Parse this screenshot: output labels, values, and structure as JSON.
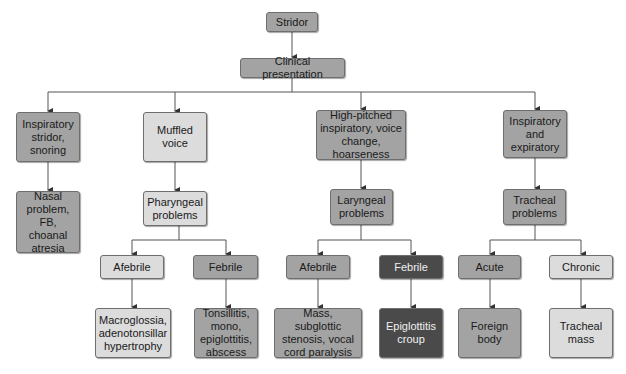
{
  "diagram": {
    "title": "Stridor",
    "colors": {
      "line": "#555555",
      "mid_gray": "#a3a3a3",
      "light_gray": "#dcdcdc",
      "dark_gray": "#4a4a4a"
    },
    "nodes": {
      "root": {
        "label": "Stridor"
      },
      "clinical": {
        "label": "Clinical presentation"
      },
      "insp_snoring": {
        "label": "Inspiratory stridor, snoring"
      },
      "muffled": {
        "label": "Muffled voice"
      },
      "high_pitched": {
        "label": "High-pitched inspiratory, voice change, hoarseness"
      },
      "insp_exp": {
        "label": "Inspiratory and expiratory"
      },
      "nasal": {
        "label": "Nasal problem, FB, choanal atresia"
      },
      "pharyngeal": {
        "label": "Pharyngeal problems"
      },
      "laryngeal": {
        "label": "Laryngeal problems"
      },
      "tracheal": {
        "label": "Tracheal problems"
      },
      "pharyngeal_afebrile": {
        "label": "Afebrile"
      },
      "pharyngeal_febrile": {
        "label": "Febrile"
      },
      "laryngeal_afebrile": {
        "label": "Afebrile"
      },
      "laryngeal_febrile": {
        "label": "Febrile"
      },
      "tracheal_acute": {
        "label": "Acute"
      },
      "tracheal_chronic": {
        "label": "Chronic"
      },
      "macroglossia": {
        "label": "Macroglossia, adenotonsillar hypertrophy"
      },
      "tonsillitis": {
        "label": "Tonsillitis, mono, epiglottitis, abscess"
      },
      "mass_subglottic": {
        "label": "Mass, subglottic stenosis, vocal cord paralysis"
      },
      "epiglottitis": {
        "label": "Epiglottitis croup"
      },
      "foreign_body": {
        "label": "Foreign body"
      },
      "tracheal_mass": {
        "label": "Tracheal mass"
      }
    },
    "edges": [
      [
        "root",
        "clinical"
      ],
      [
        "clinical",
        "insp_snoring"
      ],
      [
        "clinical",
        "muffled"
      ],
      [
        "clinical",
        "high_pitched"
      ],
      [
        "clinical",
        "insp_exp"
      ],
      [
        "insp_snoring",
        "nasal"
      ],
      [
        "muffled",
        "pharyngeal"
      ],
      [
        "high_pitched",
        "laryngeal"
      ],
      [
        "insp_exp",
        "tracheal"
      ],
      [
        "pharyngeal",
        "pharyngeal_afebrile"
      ],
      [
        "pharyngeal",
        "pharyngeal_febrile"
      ],
      [
        "laryngeal",
        "laryngeal_afebrile"
      ],
      [
        "laryngeal",
        "laryngeal_febrile"
      ],
      [
        "tracheal",
        "tracheal_acute"
      ],
      [
        "tracheal",
        "tracheal_chronic"
      ],
      [
        "pharyngeal_afebrile",
        "macroglossia"
      ],
      [
        "pharyngeal_febrile",
        "tonsillitis"
      ],
      [
        "laryngeal_afebrile",
        "mass_subglottic"
      ],
      [
        "laryngeal_febrile",
        "epiglottitis"
      ],
      [
        "tracheal_acute",
        "foreign_body"
      ],
      [
        "tracheal_chronic",
        "tracheal_mass"
      ]
    ]
  }
}
